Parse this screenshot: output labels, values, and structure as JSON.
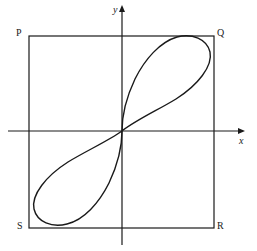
{
  "figure": {
    "type": "math-diagram",
    "background_color": "#ffffff",
    "stroke_color": "#1a1a1a",
    "axes": {
      "x_label": "x",
      "y_label": "y",
      "origin": {
        "x": 122,
        "y": 131
      },
      "x_axis": {
        "from_x": 8,
        "to_x": 245,
        "y": 131,
        "arrow": "right"
      },
      "y_axis": {
        "x": 122,
        "from_y": 245,
        "to_y": 5,
        "arrow": "up"
      }
    },
    "rectangle": {
      "name": "PQRS",
      "left": 29,
      "top": 36,
      "right": 214,
      "bottom": 228,
      "stroke_width": 1.2,
      "vertices": [
        {
          "label": "P",
          "position": "top-left",
          "x": 29,
          "y": 36
        },
        {
          "label": "Q",
          "position": "top-right",
          "x": 214,
          "y": 36
        },
        {
          "label": "R",
          "position": "bottom-right",
          "x": 214,
          "y": 228
        },
        {
          "label": "S",
          "position": "bottom-left",
          "x": 29,
          "y": 228
        }
      ]
    },
    "curve": {
      "name": "figure-eight-curve",
      "symmetry": "point-symmetric about origin",
      "stroke_width": 1.4,
      "tangent_points": [
        {
          "edge": "top",
          "x": 184,
          "y": 36
        },
        {
          "edge": "right",
          "x": 214,
          "y": 62
        },
        {
          "edge": "bottom",
          "x": 60,
          "y": 228
        },
        {
          "edge": "left",
          "x": 29,
          "y": 201
        }
      ],
      "path": "M 122 131 C 138 118 162 108 180 96 C 200 82 212 62 207 50 C 202 38 186 34 172 40 C 156 47 142 64 133 84 C 125 102 122 118 122 131 C 122 144 119 160 111 178 C 102 200 88 218 72 224 C 57 230 41 226 36 214 C 31 202 43 182 63 168 C 81 156 106 144 122 131 Z"
    }
  }
}
